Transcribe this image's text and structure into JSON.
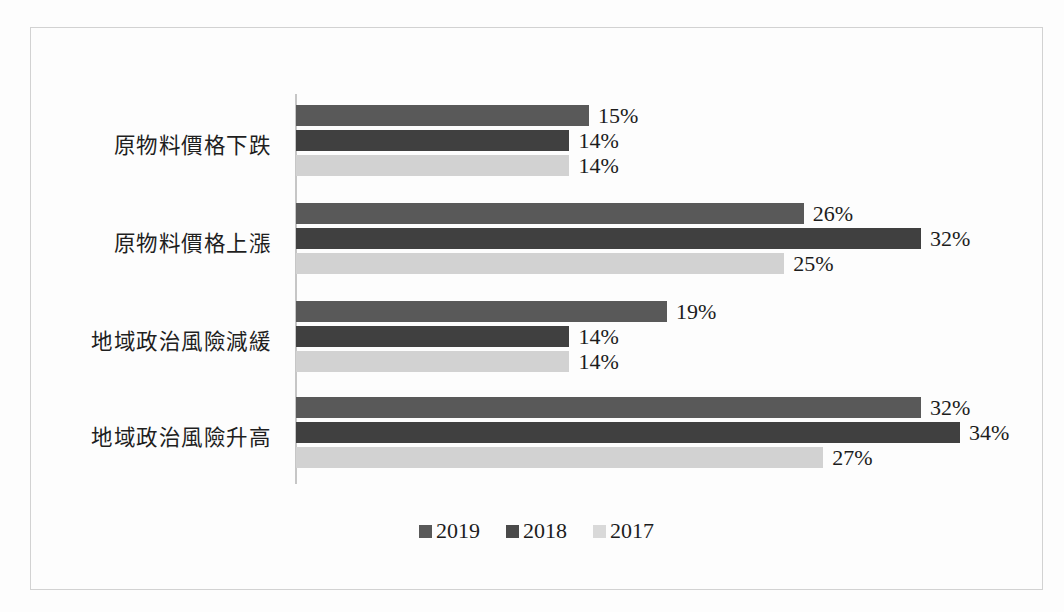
{
  "chart_data": {
    "type": "bar",
    "orientation": "horizontal",
    "title": "",
    "subtitle": "",
    "xlabel": "",
    "ylabel": "",
    "grid": false,
    "legend_position": "bottom",
    "xlim": [
      0,
      34
    ],
    "value_suffix": "%",
    "categories": [
      "原物料價格下跌",
      "原物料價格上漲",
      "地域政治風險減緩",
      "地域政治風險升高"
    ],
    "series": [
      {
        "name": "2019",
        "color": "#595959",
        "values": [
          15,
          26,
          19,
          32
        ],
        "labels": [
          "15%",
          "26%",
          "19%",
          "32%"
        ]
      },
      {
        "name": "2018",
        "color": "#404040",
        "values": [
          14,
          32,
          14,
          34
        ],
        "labels": [
          "14%",
          "32%",
          "14%",
          "34%"
        ]
      },
      {
        "name": "2017",
        "color": "#d2d2d2",
        "values": [
          14,
          25,
          14,
          27
        ],
        "labels": [
          "14%",
          "25%",
          "14%",
          "27%"
        ]
      }
    ]
  },
  "legend": {
    "items": [
      {
        "label": "2019",
        "color": "#595959"
      },
      {
        "label": "2018",
        "color": "#4a4a4a"
      },
      {
        "label": "2017",
        "color": "#d9d9d9"
      }
    ]
  }
}
